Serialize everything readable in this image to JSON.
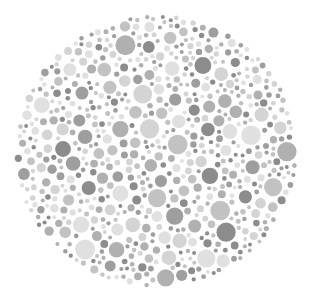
{
  "plate": {
    "kind": "dot-plate",
    "background": "#ffffff",
    "center": [
      156,
      151
    ],
    "radius_x": 142,
    "radius_y": 137,
    "palette": [
      "#8c8c8c",
      "#9e9e9e",
      "#b0b0b0",
      "#c2c2c2",
      "#d4d4d4",
      "#e0e0e0"
    ],
    "dot_radius_range": [
      2,
      10
    ],
    "seed": 7
  }
}
